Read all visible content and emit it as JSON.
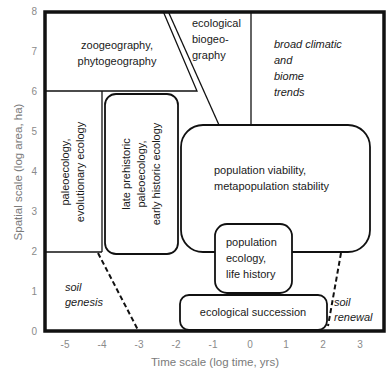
{
  "figure": {
    "x_axis": {
      "label": "Time scale (log time, yrs)",
      "ticks": [
        "-5",
        "-4",
        "-3",
        "-2",
        "-1",
        "0",
        "1",
        "2",
        "3"
      ]
    },
    "y_axis": {
      "label": "Spatial scale (log area, ha)",
      "ticks": [
        "0",
        "1",
        "2",
        "3",
        "4",
        "5",
        "6",
        "7",
        "8"
      ]
    },
    "regions": {
      "zoogeography": {
        "line1": "zoogeography,",
        "line2": "phytogeography"
      },
      "ecological_biogeography": {
        "line1": "ecological",
        "line2": "biogeo-",
        "line3": "graphy"
      },
      "broad_climatic": {
        "line1": "broad climatic",
        "line2": "and",
        "line3": "biome",
        "line4": "trends"
      },
      "paleoecology": {
        "line1": "paleoecology,",
        "line2": "evolutionary ecology"
      },
      "late_prehistoric": {
        "line1": "late prehistoric",
        "line2": "paleoecology,",
        "line3": "early historic ecology"
      },
      "population_viability": {
        "line1": "population viability,",
        "line2": "metapopulation stability"
      },
      "population_ecology": {
        "line1": "population",
        "line2": "ecology,",
        "line3": "life history"
      },
      "ecological_succession": {
        "line1": "ecological succession"
      },
      "soil_genesis": {
        "line1": "soil",
        "line2": "genesis"
      },
      "soil_renewal": {
        "line1": "soil",
        "line2": "renewal"
      }
    }
  }
}
